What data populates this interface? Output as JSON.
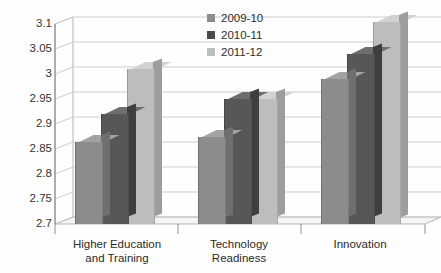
{
  "chart_data": {
    "type": "bar",
    "title": "",
    "subtitle": "",
    "xlabel": "",
    "ylabel": "",
    "categories": [
      "Higher Education and Training",
      "Technology Readiness",
      "Innovation"
    ],
    "category_lines": [
      [
        "Higher Education",
        "and Training"
      ],
      [
        "Technology",
        "Readiness"
      ],
      [
        "Innovation"
      ]
    ],
    "series": [
      {
        "name": "2009-10",
        "color": "#8c8c8c",
        "values": [
          2.865,
          2.875,
          2.99
        ]
      },
      {
        "name": "2010-11",
        "color": "#4a4a4a",
        "values": [
          2.92,
          2.95,
          3.04
        ]
      },
      {
        "name": "2011-12",
        "color": "#bdbdbd",
        "values": [
          3.01,
          2.95,
          3.105
        ]
      }
    ],
    "ylim": [
      2.7,
      3.1
    ],
    "ytick_step": 0.05,
    "ytick_labels": [
      "3.1",
      "3.05",
      "3",
      "2.95",
      "2.9",
      "2.85",
      "2.8",
      "2.75",
      "2.7"
    ],
    "ytick_values": [
      3.1,
      3.05,
      3.0,
      2.95,
      2.9,
      2.85,
      2.8,
      2.75,
      2.7
    ],
    "grid": true,
    "legend_position": "inside-top-center",
    "projection": "3d-column",
    "background_color": "#ffffff",
    "gridline_color": "#c9c9c9",
    "axis_color": "#9a9a9a"
  }
}
